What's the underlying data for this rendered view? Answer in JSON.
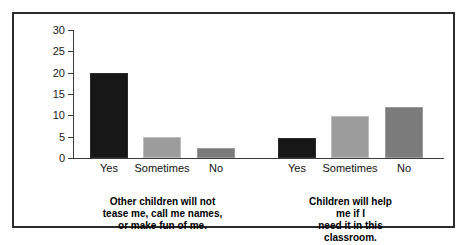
{
  "chart_data": {
    "type": "bar",
    "title": "",
    "xlabel": "",
    "ylabel": "",
    "ylim": [
      0,
      30
    ],
    "yticks": [
      0,
      5,
      10,
      15,
      20,
      25,
      30
    ],
    "grid": false,
    "legend": "none",
    "categories": [
      "Yes",
      "Sometimes",
      "No"
    ],
    "groups": [
      {
        "caption": "Other children will not\ntease me, call me names,\nor make fun of me.",
        "bars": [
          {
            "category": "Yes",
            "value": 20,
            "color": "#171717",
            "shade": "black"
          },
          {
            "category": "Sometimes",
            "value": 5,
            "color": "#9c9c9c",
            "shade": "light"
          },
          {
            "category": "No",
            "value": 2.3,
            "color": "#7b7b7b",
            "shade": "dark"
          }
        ]
      },
      {
        "caption": "Children will help me if I\nneed it in this classroom.",
        "bars": [
          {
            "category": "Yes",
            "value": 4.7,
            "color": "#171717",
            "shade": "black"
          },
          {
            "category": "Sometimes",
            "value": 9.8,
            "color": "#9c9c9c",
            "shade": "light"
          },
          {
            "category": "No",
            "value": 12,
            "color": "#7b7b7b",
            "shade": "dark"
          }
        ]
      }
    ]
  },
  "frame": {
    "border_color": "#2b2b2b",
    "background": "#ffffff"
  }
}
